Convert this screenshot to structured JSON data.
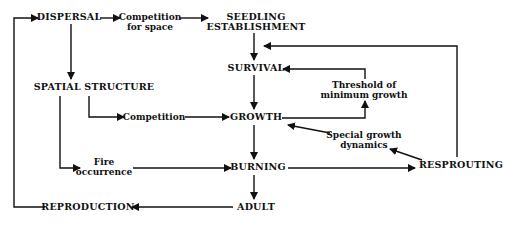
{
  "diagram": {
    "type": "flowchart",
    "line_color": "#111111",
    "background": "#ffffff",
    "nodes": {
      "dispersal": {
        "label": "DISPERSAL"
      },
      "competition_space": {
        "line1": "Competition",
        "line2": "for space"
      },
      "seedling": {
        "line1": "SEEDLING",
        "line2": "ESTABLISHMENT"
      },
      "survival": {
        "label": "SURVIVAL"
      },
      "spatial": {
        "label": "SPATIAL STRUCTURE"
      },
      "competition": {
        "label": "Competition"
      },
      "growth": {
        "label": "GROWTH"
      },
      "threshold": {
        "line1": "Threshold of",
        "line2": "minimum growth"
      },
      "special": {
        "line1": "Special growth",
        "line2": "dynamics"
      },
      "fire": {
        "line1": "Fire",
        "line2": "occurrence"
      },
      "burning": {
        "label": "BURNING"
      },
      "resprouting": {
        "label": "RESPROUTING"
      },
      "reproduction": {
        "label": "REPRODUCTION"
      },
      "adult": {
        "label": "ADULT"
      }
    },
    "edges": [
      {
        "from": "reproduction",
        "to": "dispersal"
      },
      {
        "from": "dispersal",
        "to": "competition_space"
      },
      {
        "from": "competition_space",
        "to": "seedling"
      },
      {
        "from": "dispersal",
        "to": "spatial"
      },
      {
        "from": "seedling",
        "to": "survival"
      },
      {
        "from": "resprouting",
        "to": "survival_entry"
      },
      {
        "from": "threshold",
        "to": "survival"
      },
      {
        "from": "growth",
        "to": "threshold"
      },
      {
        "from": "survival",
        "to": "growth"
      },
      {
        "from": "spatial",
        "to": "competition"
      },
      {
        "from": "competition",
        "to": "growth"
      },
      {
        "from": "special",
        "to": "growth"
      },
      {
        "from": "resprouting",
        "to": "special"
      },
      {
        "from": "spatial",
        "to": "fire"
      },
      {
        "from": "fire",
        "to": "burning"
      },
      {
        "from": "growth",
        "to": "burning"
      },
      {
        "from": "burning",
        "to": "resprouting"
      },
      {
        "from": "burning",
        "to": "adult"
      },
      {
        "from": "adult",
        "to": "reproduction"
      }
    ]
  }
}
